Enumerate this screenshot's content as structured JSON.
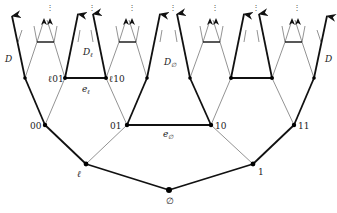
{
  "diagram": {
    "nodes": {
      "root": "∅",
      "l": "ℓ",
      "one": "1",
      "n00": "00",
      "n01": "01",
      "n10": "10",
      "n11": "11",
      "l01": "ℓ01",
      "l10": "ℓ10"
    },
    "edges": {
      "e_l": "e",
      "e_l_sub": "ℓ",
      "e_empty": "e",
      "e_empty_sub": "∅"
    },
    "regions": {
      "D_left": "D",
      "D_right": "D",
      "D_l": "D",
      "D_l_sub": "ℓ",
      "D_empty": "D",
      "D_empty_sub": "∅"
    },
    "continuation": "⋮",
    "colors": {
      "thick_edge": "#111111",
      "thin_edge": "#777777",
      "node": "#000000"
    }
  }
}
